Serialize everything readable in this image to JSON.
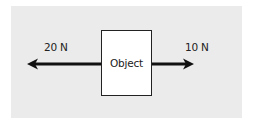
{
  "diagram": {
    "type": "free-body-diagram",
    "object": {
      "label": "Object"
    },
    "forces": [
      {
        "label": "20 N",
        "direction": "left",
        "magnitude": 20,
        "unit": "N"
      },
      {
        "label": "10 N",
        "direction": "right",
        "magnitude": 10,
        "unit": "N"
      }
    ],
    "colors": {
      "panel_background": "#ebebeb",
      "object_fill": "#ffffff",
      "stroke": "#111111"
    }
  }
}
